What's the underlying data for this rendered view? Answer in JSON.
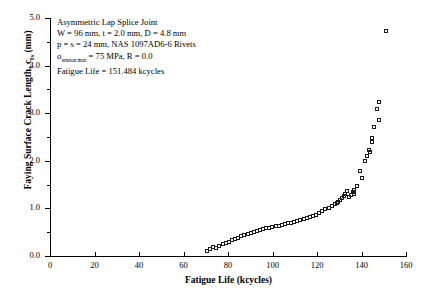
{
  "chart_data": {
    "type": "scatter",
    "title": "",
    "xlabel": "Fatigue Life (kcycles)",
    "ylabel": "Faying Surface Crack Length, c_fs (mm)",
    "ylabel_main": "Faying Surface Crack Length, c",
    "ylabel_sub": "fs",
    "ylabel_unit": " (mm)",
    "xlim": [
      0,
      160
    ],
    "ylim": [
      0.0,
      5.0
    ],
    "xticks": [
      0,
      20,
      40,
      60,
      80,
      100,
      120,
      140,
      160
    ],
    "xtick_labels": [
      "0",
      "20",
      "40",
      "60",
      "80",
      "100",
      "120",
      "140",
      "160"
    ],
    "yticks": [
      0.0,
      1.0,
      2.0,
      3.0,
      4.0,
      5.0
    ],
    "ytick_labels": [
      "0.0",
      "1.0",
      "2.0",
      "3.0",
      "4.0",
      "5.0"
    ],
    "ytick_minor": [
      0.5,
      1.5,
      2.5,
      3.5,
      4.5
    ],
    "grid": false,
    "legend": false,
    "marker": "open-square",
    "marker_color": "#1a1a1a",
    "series": [
      {
        "name": "Faying surface crack growth",
        "x": [
          71.0,
          72.3,
          73.6,
          75.0,
          76.4,
          77.8,
          79.2,
          80.6,
          82.0,
          83.4,
          84.8,
          86.2,
          87.6,
          89.0,
          90.4,
          91.8,
          93.2,
          94.6,
          96.0,
          97.4,
          98.8,
          100.2,
          101.6,
          103.0,
          104.4,
          105.8,
          107.2,
          108.6,
          110.0,
          111.4,
          112.8,
          114.2,
          115.6,
          117.0,
          118.4,
          119.8,
          121.2,
          122.6,
          124.0,
          125.4,
          126.8,
          128.2,
          129.0,
          129.8,
          130.6,
          131.4,
          132.2,
          133.0,
          133.8,
          134.6,
          135.4,
          136.2,
          137.0,
          137.0,
          138.2,
          139.4,
          140.6,
          141.8,
          142.6,
          143.4,
          144.2,
          145.0,
          145.0,
          146.0,
          147.0,
          148.0,
          148.0,
          151.4
        ],
        "y": [
          0.1,
          0.13,
          0.17,
          0.16,
          0.21,
          0.24,
          0.26,
          0.29,
          0.32,
          0.34,
          0.37,
          0.4,
          0.43,
          0.45,
          0.47,
          0.49,
          0.51,
          0.53,
          0.55,
          0.57,
          0.58,
          0.6,
          0.62,
          0.63,
          0.65,
          0.66,
          0.68,
          0.69,
          0.71,
          0.72,
          0.74,
          0.76,
          0.78,
          0.8,
          0.83,
          0.86,
          0.89,
          0.93,
          0.97,
          1.0,
          1.04,
          1.08,
          1.1,
          1.13,
          1.16,
          1.2,
          1.24,
          1.3,
          1.36,
          1.22,
          1.28,
          1.33,
          1.38,
          1.3,
          1.45,
          1.78,
          1.62,
          1.98,
          2.08,
          2.22,
          2.18,
          2.46,
          2.38,
          2.7,
          3.08,
          3.22,
          2.85,
          4.72
        ]
      }
    ]
  },
  "annotation": {
    "lines": [
      "Asymmetric Lap Splice Joint",
      "W = 96 mm, t = 2.0 mm, D = 4.8 mm",
      "p = s = 24 mm, NAS 1097AD6-6 Rivets"
    ],
    "stress_prefix": "σ",
    "stress_sub": "tension max",
    "stress_value": " = 75 MPa, R = 0.0",
    "fatigue_life": "Fatigue Life = 151.484 kcycles"
  }
}
